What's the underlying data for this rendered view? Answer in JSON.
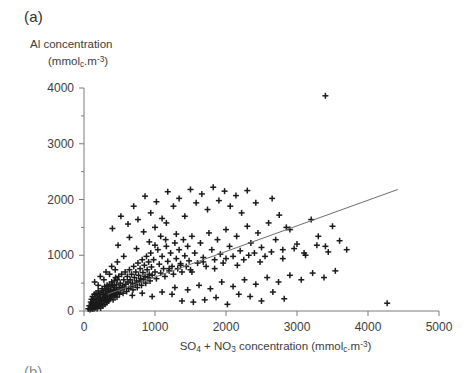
{
  "figure": {
    "panel_label": "(a)",
    "next_panel_label": "(b)"
  },
  "axis_titles": {
    "y_line1": "Al concentration",
    "y_line2_prefix": "(mmol",
    "y_line2_sub": "c",
    "y_line2_mid": ".m",
    "y_line2_sup": "-3",
    "y_line2_suffix": ")",
    "x_prefix": "SO",
    "x_sub1": "4",
    "x_mid1": " + NO",
    "x_sub2": "3",
    "x_mid2": " concentration (mmol",
    "x_sub3": "c",
    "x_mid3": ".m",
    "x_sup": "-3",
    "x_suffix": ")"
  },
  "chart_data": {
    "type": "scatter",
    "title": "(a)",
    "xlabel": "SO4 + NO3 concentration (mmolc.m-3)",
    "ylabel": "Al concentration (mmolc.m-3)",
    "xlim": [
      0,
      5000
    ],
    "ylim": [
      0,
      4000
    ],
    "xticks": [
      0,
      1000,
      2000,
      3000,
      4000,
      5000
    ],
    "yticks": [
      0,
      1000,
      2000,
      3000,
      4000
    ],
    "xtick_labels": [
      "0",
      "1000",
      "2000",
      "3000",
      "4000",
      "5000"
    ],
    "ytick_labels": [
      "0",
      "1000",
      "2000",
      "3000",
      "4000"
    ],
    "grid": false,
    "legend": null,
    "marker": "plus",
    "marker_color": "#1a1a1a",
    "axis_color": "#7a7a7a",
    "regression_line": {
      "label": "fitted line",
      "color": "#6d6d6d",
      "x_start": 330,
      "y_start": 300,
      "x_end": 4420,
      "y_end": 2180
    },
    "points": [
      [
        60,
        40
      ],
      [
        75,
        95
      ],
      [
        85,
        25
      ],
      [
        95,
        160
      ],
      [
        100,
        60
      ],
      [
        105,
        210
      ],
      [
        110,
        110
      ],
      [
        115,
        35
      ],
      [
        120,
        260
      ],
      [
        125,
        140
      ],
      [
        130,
        70
      ],
      [
        135,
        190
      ],
      [
        140,
        40
      ],
      [
        145,
        300
      ],
      [
        150,
        110
      ],
      [
        155,
        230
      ],
      [
        160,
        60
      ],
      [
        165,
        160
      ],
      [
        170,
        320
      ],
      [
        175,
        95
      ],
      [
        180,
        200
      ],
      [
        185,
        45
      ],
      [
        190,
        270
      ],
      [
        195,
        130
      ],
      [
        200,
        360
      ],
      [
        205,
        80
      ],
      [
        210,
        220
      ],
      [
        215,
        170
      ],
      [
        220,
        300
      ],
      [
        225,
        110
      ],
      [
        230,
        250
      ],
      [
        235,
        55
      ],
      [
        240,
        330
      ],
      [
        245,
        190
      ],
      [
        250,
        140
      ],
      [
        255,
        400
      ],
      [
        260,
        230
      ],
      [
        265,
        90
      ],
      [
        270,
        290
      ],
      [
        275,
        360
      ],
      [
        280,
        170
      ],
      [
        285,
        240
      ],
      [
        290,
        440
      ],
      [
        295,
        120
      ],
      [
        300,
        320
      ],
      [
        305,
        200
      ],
      [
        310,
        380
      ],
      [
        315,
        260
      ],
      [
        320,
        150
      ],
      [
        325,
        460
      ],
      [
        330,
        300
      ],
      [
        335,
        220
      ],
      [
        340,
        400
      ],
      [
        345,
        180
      ],
      [
        350,
        340
      ],
      [
        355,
        260
      ],
      [
        360,
        480
      ],
      [
        365,
        210
      ],
      [
        370,
        360
      ],
      [
        375,
        290
      ],
      [
        380,
        430
      ],
      [
        385,
        250
      ],
      [
        390,
        520
      ],
      [
        395,
        330
      ],
      [
        400,
        280
      ],
      [
        405,
        460
      ],
      [
        410,
        200
      ],
      [
        415,
        380
      ],
      [
        420,
        310
      ],
      [
        425,
        540
      ],
      [
        430,
        420
      ],
      [
        435,
        270
      ],
      [
        440,
        350
      ],
      [
        445,
        600
      ],
      [
        450,
        300
      ],
      [
        455,
        470
      ],
      [
        460,
        390
      ],
      [
        465,
        250
      ],
      [
        470,
        560
      ],
      [
        480,
        330
      ],
      [
        490,
        620
      ],
      [
        495,
        420
      ],
      [
        500,
        300
      ],
      [
        510,
        500
      ],
      [
        520,
        380
      ],
      [
        530,
        660
      ],
      [
        540,
        450
      ],
      [
        550,
        320
      ],
      [
        560,
        560
      ],
      [
        570,
        420
      ],
      [
        580,
        700
      ],
      [
        590,
        480
      ],
      [
        600,
        350
      ],
      [
        610,
        620
      ],
      [
        620,
        520
      ],
      [
        630,
        400
      ],
      [
        640,
        740
      ],
      [
        650,
        560
      ],
      [
        660,
        440
      ],
      [
        670,
        660
      ],
      [
        680,
        500
      ],
      [
        690,
        380
      ],
      [
        700,
        800
      ],
      [
        710,
        600
      ],
      [
        720,
        470
      ],
      [
        730,
        700
      ],
      [
        740,
        540
      ],
      [
        750,
        420
      ],
      [
        760,
        860
      ],
      [
        770,
        640
      ],
      [
        780,
        520
      ],
      [
        790,
        760
      ],
      [
        800,
        580
      ],
      [
        810,
        460
      ],
      [
        820,
        920
      ],
      [
        830,
        690
      ],
      [
        840,
        560
      ],
      [
        850,
        820
      ],
      [
        860,
        620
      ],
      [
        870,
        500
      ],
      [
        880,
        980
      ],
      [
        890,
        740
      ],
      [
        900,
        600
      ],
      [
        910,
        880
      ],
      [
        920,
        660
      ],
      [
        930,
        540
      ],
      [
        940,
        1040
      ],
      [
        950,
        790
      ],
      [
        960,
        640
      ],
      [
        980,
        920
      ],
      [
        1000,
        700
      ],
      [
        1020,
        580
      ],
      [
        1040,
        1100
      ],
      [
        1060,
        840
      ],
      [
        1080,
        680
      ],
      [
        1100,
        980
      ],
      [
        1120,
        760
      ],
      [
        1140,
        620
      ],
      [
        1160,
        1160
      ],
      [
        1180,
        890
      ],
      [
        1200,
        720
      ],
      [
        1220,
        1040
      ],
      [
        1240,
        800
      ],
      [
        1260,
        660
      ],
      [
        1280,
        1220
      ],
      [
        1300,
        940
      ],
      [
        1320,
        760
      ],
      [
        1340,
        1100
      ],
      [
        1360,
        850
      ],
      [
        1380,
        700
      ],
      [
        1400,
        1280
      ],
      [
        1420,
        990
      ],
      [
        1440,
        800
      ],
      [
        1460,
        1160
      ],
      [
        1480,
        900
      ],
      [
        1500,
        740
      ],
      [
        1520,
        1340
      ],
      [
        1560,
        1040
      ],
      [
        1600,
        860
      ],
      [
        1640,
        1220
      ],
      [
        1680,
        960
      ],
      [
        1720,
        800
      ],
      [
        1760,
        1400
      ],
      [
        1800,
        1100
      ],
      [
        1840,
        920
      ],
      [
        1880,
        1280
      ],
      [
        1920,
        1020
      ],
      [
        1960,
        860
      ],
      [
        2000,
        1460
      ],
      [
        2050,
        1160
      ],
      [
        2100,
        980
      ],
      [
        2150,
        1340
      ],
      [
        2200,
        1080
      ],
      [
        2250,
        920
      ],
      [
        2300,
        1520
      ],
      [
        2350,
        1220
      ],
      [
        2400,
        1040
      ],
      [
        2450,
        1400
      ],
      [
        2500,
        1140
      ],
      [
        2550,
        980
      ],
      [
        2600,
        1580
      ],
      [
        2700,
        1280
      ],
      [
        2800,
        1100
      ],
      [
        2900,
        1460
      ],
      [
        3000,
        1200
      ],
      [
        3100,
        1040
      ],
      [
        3200,
        1640
      ],
      [
        3300,
        1340
      ],
      [
        3400,
        1160
      ],
      [
        3500,
        1520
      ],
      [
        3600,
        1260
      ],
      [
        3700,
        1100
      ],
      [
        400,
        1480
      ],
      [
        520,
        1700
      ],
      [
        620,
        1560
      ],
      [
        700,
        1880
      ],
      [
        760,
        1640
      ],
      [
        860,
        2060
      ],
      [
        940,
        1760
      ],
      [
        1020,
        1960
      ],
      [
        1100,
        1660
      ],
      [
        1180,
        2140
      ],
      [
        1260,
        1880
      ],
      [
        1340,
        2020
      ],
      [
        1420,
        1700
      ],
      [
        1500,
        2180
      ],
      [
        1580,
        1940
      ],
      [
        1660,
        2100
      ],
      [
        1740,
        1820
      ],
      [
        1820,
        2220
      ],
      [
        1900,
        1980
      ],
      [
        1980,
        2150
      ],
      [
        2060,
        1880
      ],
      [
        2140,
        2070
      ],
      [
        2220,
        1760
      ],
      [
        2300,
        2160
      ],
      [
        2420,
        1940
      ],
      [
        480,
        1180
      ],
      [
        560,
        980
      ],
      [
        640,
        1320
      ],
      [
        740,
        1120
      ],
      [
        840,
        1420
      ],
      [
        920,
        1240
      ],
      [
        1000,
        1500
      ],
      [
        1080,
        1340
      ],
      [
        1160,
        1580
      ],
      [
        2650,
        2020
      ],
      [
        2750,
        1720
      ],
      [
        2850,
        1500
      ],
      [
        3400,
        3860
      ],
      [
        4270,
        140
      ],
      [
        1380,
        180
      ],
      [
        1540,
        160
      ],
      [
        1700,
        200
      ],
      [
        1860,
        240
      ],
      [
        2020,
        120
      ],
      [
        2180,
        300
      ],
      [
        2340,
        260
      ],
      [
        2500,
        180
      ],
      [
        2660,
        340
      ],
      [
        2820,
        220
      ],
      [
        1280,
        420
      ],
      [
        1460,
        380
      ],
      [
        1620,
        460
      ],
      [
        1780,
        400
      ],
      [
        1940,
        520
      ],
      [
        2100,
        440
      ],
      [
        2260,
        560
      ],
      [
        2420,
        480
      ],
      [
        2580,
        600
      ],
      [
        2740,
        520
      ],
      [
        2900,
        640
      ],
      [
        3060,
        560
      ],
      [
        3220,
        680
      ],
      [
        3380,
        600
      ],
      [
        3540,
        720
      ],
      [
        1200,
        760
      ],
      [
        1360,
        820
      ],
      [
        1520,
        700
      ],
      [
        1680,
        880
      ],
      [
        1840,
        760
      ],
      [
        2000,
        940
      ],
      [
        2160,
        820
      ],
      [
        2320,
        1000
      ],
      [
        2480,
        880
      ],
      [
        2640,
        1060
      ],
      [
        2800,
        940
      ],
      [
        2960,
        1120
      ],
      [
        3120,
        1000
      ],
      [
        3280,
        1180
      ],
      [
        3440,
        1060
      ],
      [
        680,
        280
      ],
      [
        820,
        320
      ],
      [
        960,
        260
      ],
      [
        1100,
        340
      ],
      [
        1240,
        300
      ],
      [
        150,
        520
      ],
      [
        230,
        620
      ],
      [
        310,
        700
      ],
      [
        390,
        800
      ],
      [
        470,
        880
      ],
      [
        200,
        460
      ],
      [
        280,
        560
      ],
      [
        360,
        660
      ],
      [
        440,
        740
      ],
      [
        1000,
        1180
      ],
      [
        1150,
        1280
      ],
      [
        1300,
        1380
      ]
    ]
  }
}
